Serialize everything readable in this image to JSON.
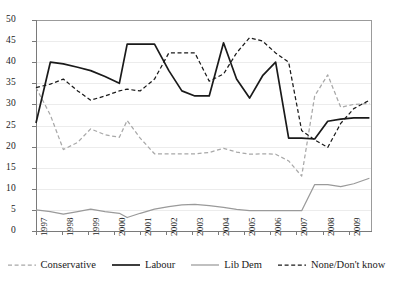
{
  "chart_data": {
    "type": "line",
    "title": "",
    "subtitle": "",
    "xlabel": "",
    "ylabel": "",
    "xlim": [
      1997,
      2009.9
    ],
    "ylim": [
      0,
      50
    ],
    "ytick_step": 5,
    "yticks": [
      0,
      5,
      10,
      15,
      20,
      25,
      30,
      35,
      40,
      45,
      50
    ],
    "xticks": [
      1997,
      1998,
      1999,
      2000,
      2001,
      2002,
      2003,
      2004,
      2005,
      2006,
      2007,
      2008,
      2009
    ],
    "categories": [
      "1997",
      "1998",
      "1999",
      "2000",
      "2001",
      "2002",
      "2003",
      "2004",
      "2005",
      "2006",
      "2007",
      "2008",
      "2009"
    ],
    "grid": "horizontal",
    "legend_position": "bottom",
    "series": [
      {
        "name": "Conservative",
        "color": "#a8a8a8",
        "style": "dashed",
        "x": [
          1997.0,
          1997.55,
          1998.05,
          1998.6,
          1999.1,
          1999.65,
          2000.2,
          2000.5,
          2001.0,
          2001.55,
          2002.1,
          2002.6,
          2003.1,
          2003.65,
          2004.2,
          2004.7,
          2005.2,
          2005.7,
          2006.2,
          2006.7,
          2007.2,
          2007.7,
          2008.2,
          2008.7,
          2009.2,
          2009.8
        ],
        "values": [
          34.0,
          27.5,
          19.3,
          21.0,
          24.2,
          22.8,
          22.2,
          26.2,
          22.0,
          18.3,
          18.3,
          18.3,
          18.3,
          18.6,
          19.6,
          18.7,
          18.2,
          18.3,
          18.2,
          16.6,
          13.0,
          32.0,
          37.0,
          29.3,
          30.0,
          30.2
        ]
      },
      {
        "name": "Labour",
        "color": "#1a1a1a",
        "style": "solid",
        "x": [
          1997.0,
          1997.55,
          1998.05,
          1998.6,
          1999.1,
          1999.65,
          2000.2,
          2000.5,
          2001.0,
          2001.55,
          2002.1,
          2002.6,
          2003.1,
          2003.65,
          2004.2,
          2004.7,
          2005.2,
          2005.7,
          2006.2,
          2006.7,
          2007.2,
          2007.7,
          2008.2,
          2008.7,
          2009.2,
          2009.8
        ],
        "values": [
          25.6,
          40.0,
          39.6,
          38.8,
          38.0,
          36.6,
          35.0,
          44.3,
          44.3,
          44.3,
          38.0,
          33.2,
          32.0,
          32.0,
          44.6,
          36.0,
          31.5,
          36.8,
          40.0,
          22.0,
          22.0,
          21.8,
          26.0,
          26.5,
          26.8,
          26.8
        ]
      },
      {
        "name": "Lib Dem",
        "color": "#9a9a9a",
        "style": "solid",
        "x": [
          1997.0,
          1997.55,
          1998.05,
          1998.6,
          1999.1,
          1999.65,
          2000.2,
          2000.5,
          2001.0,
          2001.55,
          2002.1,
          2002.6,
          2003.1,
          2003.65,
          2004.2,
          2004.7,
          2005.2,
          2005.7,
          2006.2,
          2006.7,
          2007.2,
          2007.7,
          2008.2,
          2008.7,
          2009.2,
          2009.8
        ],
        "values": [
          5.0,
          4.6,
          4.0,
          4.6,
          5.2,
          4.6,
          4.2,
          3.2,
          4.2,
          5.2,
          5.8,
          6.2,
          6.3,
          6.0,
          5.6,
          5.1,
          4.8,
          4.8,
          4.8,
          4.8,
          4.8,
          11.0,
          11.0,
          10.5,
          11.2,
          12.5
        ]
      },
      {
        "name": "None/Don't know",
        "color": "#1a1a1a",
        "style": "dashed",
        "x": [
          1997.0,
          1997.55,
          1998.05,
          1998.6,
          1999.1,
          1999.65,
          2000.2,
          2000.5,
          2001.0,
          2001.55,
          2002.1,
          2002.6,
          2003.1,
          2003.65,
          2004.2,
          2004.7,
          2005.2,
          2005.7,
          2006.2,
          2006.7,
          2007.2,
          2007.7,
          2008.2,
          2008.7,
          2009.2,
          2009.8
        ],
        "values": [
          34.0,
          34.8,
          36.0,
          33.2,
          31.0,
          32.0,
          33.2,
          33.6,
          33.2,
          36.0,
          42.2,
          42.2,
          42.2,
          35.5,
          37.2,
          42.2,
          45.8,
          45.0,
          42.2,
          40.0,
          23.8,
          21.6,
          19.8,
          25.5,
          29.0,
          31.0
        ]
      }
    ]
  },
  "legend": {
    "items": [
      {
        "label": "Conservative",
        "swatch": "dashed-light"
      },
      {
        "label": "Labour",
        "swatch": "solid-dark"
      },
      {
        "label": "Lib Dem",
        "swatch": "solid-light"
      },
      {
        "label": "None/Don't know",
        "swatch": "dashed-dark"
      }
    ]
  }
}
